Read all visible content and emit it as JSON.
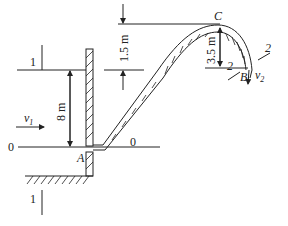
{
  "figure": {
    "type": "hydraulics siphon diagram",
    "sections": {
      "section_1_top_label": "1",
      "section_1_bottom_label": "1",
      "section_2_left_label": "2",
      "section_2_right_label": "2",
      "datum_left_label": "0",
      "datum_right_label": "0"
    },
    "points": {
      "A": "A",
      "B": "B",
      "C": "C"
    },
    "velocities": {
      "v1_main": "v",
      "v1_sub": "1",
      "v2_main": "v",
      "v2_sub": "2"
    },
    "dimensions": {
      "tank_depth": "8 m",
      "crest_above_surface": "1.5 m",
      "crest_to_outlet": "3.5 m"
    },
    "colors": {
      "line": "#222222",
      "background": "#ffffff"
    }
  }
}
